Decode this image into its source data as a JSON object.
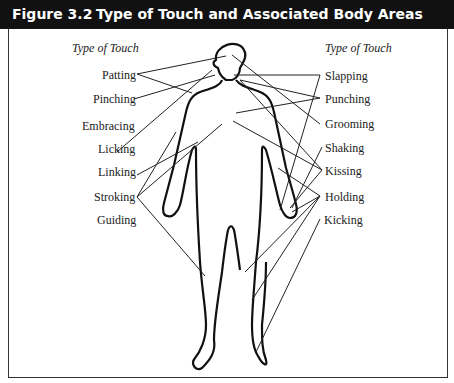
{
  "figure": {
    "number": "Figure 3.2",
    "title": "Type of Touch and Associated Body Areas"
  },
  "left_column": {
    "heading": "Type of Touch",
    "labels": [
      "Patting",
      "Pinching",
      "Embracing",
      "Licking",
      "Linking",
      "Stroking",
      "Guiding"
    ]
  },
  "right_column": {
    "heading": "Type of Touch",
    "labels": [
      "Slapping",
      "Punching",
      "Grooming",
      "Shaking",
      "Kissing",
      "Holding",
      "Kicking"
    ]
  },
  "colors": {
    "header_bg": "#111111",
    "header_text": "#ffffff",
    "line": "#222222"
  }
}
